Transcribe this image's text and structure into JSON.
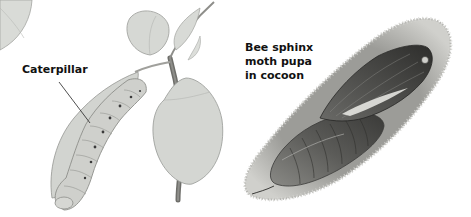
{
  "illustration": {
    "labels": {
      "caterpillar": "Caterpillar",
      "pupa": [
        "Bee sphinx",
        "moth pupa",
        "in cocoon"
      ]
    },
    "colors": {
      "background": "#ffffff",
      "leaf_fill": "#d9dbd7",
      "leaf_stroke": "#9a9c98",
      "stem": "#6e6e6a",
      "caterpillar_body": "#cfd0cc",
      "caterpillar_stroke": "#8d8e8a",
      "spiracle": "#3a3a3a",
      "cocoon_fill": "#a9a9a5",
      "cocoon_edge": "#c8c8c4",
      "pupa_dark": "#3d3d3b",
      "pupa_mid": "#6d6d6a",
      "pupa_light": "#b0b0ac",
      "text": "#111111"
    }
  }
}
